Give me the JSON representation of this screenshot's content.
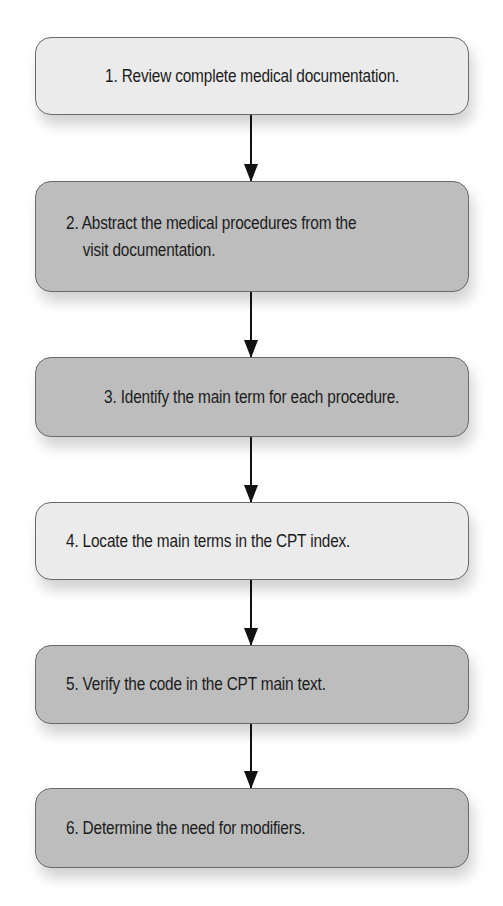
{
  "diagram": {
    "type": "flowchart",
    "direction": "top-to-bottom",
    "colors": {
      "light_fill": "#ebebeb",
      "dark_fill": "#bdbdbd",
      "border": "#6a6a6a",
      "arrow": "#111111",
      "text": "#1b1b1b"
    },
    "steps": [
      {
        "number": "1.",
        "text": "Review complete medical documentation.",
        "lines": [
          "1. Review complete medical documentation."
        ],
        "shade": "light"
      },
      {
        "number": "2.",
        "text": "Abstract the medical procedures from the visit documentation.",
        "lines": [
          "2. Abstract the medical procedures from the",
          "visit documentation."
        ],
        "shade": "dark"
      },
      {
        "number": "3.",
        "text": "Identify the main term for each procedure.",
        "lines": [
          "3. Identify the main term for each procedure."
        ],
        "shade": "dark"
      },
      {
        "number": "4.",
        "text": "Locate the main terms in the CPT index.",
        "lines": [
          "4. Locate the main terms in the CPT index."
        ],
        "shade": "light"
      },
      {
        "number": "5.",
        "text": "Verify the code in the CPT main text.",
        "lines": [
          "5. Verify the code in the CPT main text."
        ],
        "shade": "dark"
      },
      {
        "number": "6.",
        "text": "Determine the need for modifiers.",
        "lines": [
          "6. Determine the need for modifiers."
        ],
        "shade": "dark"
      }
    ],
    "connections": [
      {
        "from": 1,
        "to": 2
      },
      {
        "from": 2,
        "to": 3
      },
      {
        "from": 3,
        "to": 4
      },
      {
        "from": 4,
        "to": 5
      },
      {
        "from": 5,
        "to": 6
      }
    ]
  }
}
